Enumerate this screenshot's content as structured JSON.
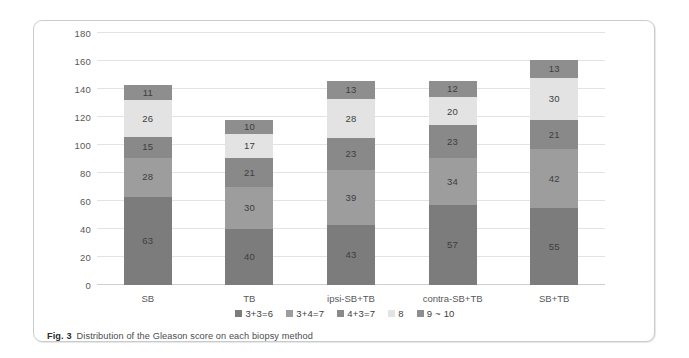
{
  "figure": {
    "caption_label": "Fig. 3",
    "caption_text": "Distribution of the Gleason score on each biopsy method"
  },
  "chart_data": {
    "type": "bar",
    "stacked": true,
    "title": "",
    "xlabel": "",
    "ylabel": "",
    "ylim": [
      0,
      180
    ],
    "ytick_step": 20,
    "yticks": [
      0,
      20,
      40,
      60,
      80,
      100,
      120,
      140,
      160,
      180
    ],
    "grid": true,
    "legend_position": "bottom",
    "categories": [
      "SB",
      "TB",
      "ipsi-SB+TB",
      "contra-SB+TB",
      "SB+TB"
    ],
    "series": [
      {
        "name": "3+3=6",
        "color": "#7c7c7c",
        "values": [
          63,
          40,
          43,
          57,
          55
        ]
      },
      {
        "name": "3+4=7",
        "color": "#9d9d9d",
        "values": [
          28,
          30,
          39,
          34,
          42
        ]
      },
      {
        "name": "4+3=7",
        "color": "#898989",
        "values": [
          15,
          21,
          23,
          23,
          21
        ]
      },
      {
        "name": "8",
        "color": "#e3e3e3",
        "values": [
          26,
          17,
          28,
          20,
          30
        ]
      },
      {
        "name": "9 ~ 10",
        "color": "#8e8e8e",
        "values": [
          11,
          10,
          13,
          12,
          13
        ]
      }
    ],
    "totals": [
      143,
      118,
      146,
      146,
      161
    ]
  }
}
